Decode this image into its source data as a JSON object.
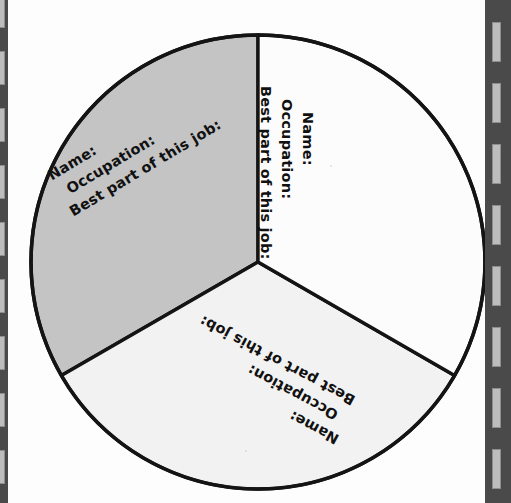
{
  "page": {
    "background_color": "#fdfdfd",
    "width": 511,
    "height": 503
  },
  "binding": {
    "edge_color": "#4a4a4a",
    "tick_color": "#bdbdbd",
    "left_ticks": 9,
    "right_ticks": 8
  },
  "wheel": {
    "center_x": 258,
    "center_y": 262,
    "radius": 227,
    "outline_color": "#141414",
    "outline_width": 3.4,
    "segment_count": 3,
    "segments": [
      {
        "id": "right",
        "name": "right-segment",
        "fill": "#fcfcfc",
        "start_angle": 270,
        "end_angle": 30,
        "rotation_deg": 90,
        "lines": [
          "Name:",
          "Occupation:",
          "Best part of this job:"
        ]
      },
      {
        "id": "bottom",
        "name": "bottom-segment",
        "fill": "#f2f2f2",
        "start_angle": 30,
        "end_angle": 150,
        "rotation_deg": 208,
        "lines": [
          "Name:",
          "Occupation:",
          "Best part of this job:"
        ]
      },
      {
        "id": "left",
        "name": "left-segment",
        "fill": "#c4c4c4",
        "start_angle": 150,
        "end_angle": 270,
        "rotation_deg": -31,
        "lines": [
          "Name:",
          "Occupation:",
          "Best part of this job:"
        ]
      }
    ]
  },
  "prompts": {
    "name_label": "Name:",
    "occupation_label": "Occupation:",
    "best_part_label": "Best part of this job:"
  },
  "chart_data": {
    "type": "pie",
    "title": "",
    "categories": [
      "Segment 1",
      "Segment 2",
      "Segment 3"
    ],
    "values": [
      33.3,
      33.3,
      33.3
    ],
    "colors": [
      "#fcfcfc",
      "#f2f2f2",
      "#c4c4c4"
    ],
    "legend": "none",
    "labels_in_slices": [
      "Name:",
      "Occupation:",
      "Best part of this job:"
    ]
  }
}
